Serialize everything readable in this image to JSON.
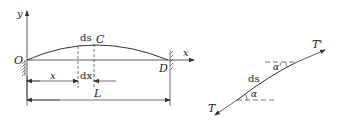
{
  "left_figure": {
    "axis_y_label": "y",
    "axis_x_label": "x",
    "origin_label": "O",
    "end_label": "D",
    "apex_label": "C",
    "element_label": "ds",
    "dim_x_label": "x",
    "dim_dx_label": "dx",
    "dim_L_label": "L"
  },
  "right_figure": {
    "tension_start_label": "T",
    "tension_end_label": "T'",
    "element_label": "ds",
    "angle_start_label": "α",
    "angle_end_label": "α'"
  },
  "colors": {
    "line": "#333333",
    "background": "#ffffff"
  }
}
